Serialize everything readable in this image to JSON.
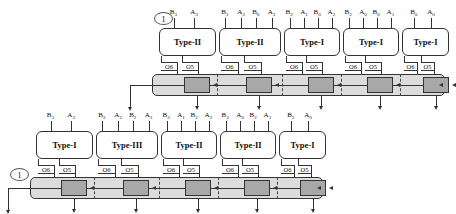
{
  "diagram": {
    "colors": {
      "bus_fill": "#dcdcdc",
      "register_fill": "#a8a8a8",
      "line": "#333333",
      "cell_fill": "#ffffff"
    },
    "output_taps": {
      "left_label": "O6",
      "right_label": "O5"
    },
    "rows": [
      {
        "id": "row-top",
        "marker": "1",
        "cells": [
          {
            "type": "Type-II",
            "inputs": [
              "B3",
              "A3"
            ]
          },
          {
            "type": "Type-II",
            "inputs": [
              "B3",
              "A2",
              "B0",
              "A3"
            ]
          },
          {
            "type": "Type-I",
            "inputs": [
              "B2",
              "A1",
              "B0",
              "A2"
            ]
          },
          {
            "type": "Type-I",
            "inputs": [
              "B2",
              "A0",
              "B0",
              "A1"
            ]
          },
          {
            "type": "Type-I",
            "inputs": [
              "B0",
              "A0"
            ]
          }
        ]
      },
      {
        "id": "row-bottom",
        "marker": "1",
        "cells": [
          {
            "type": "Type-I",
            "inputs": [
              "B3",
              "A3"
            ]
          },
          {
            "type": "Type-III",
            "inputs": [
              "B3",
              "A2",
              "B2",
              "A3"
            ]
          },
          {
            "type": "Type-II",
            "inputs": [
              "B3",
              "A1",
              "B2",
              "A2"
            ]
          },
          {
            "type": "Type-II",
            "inputs": [
              "B3",
              "A0",
              "B2",
              "A1"
            ]
          },
          {
            "type": "Type-I",
            "inputs": [
              "B2",
              "A0"
            ]
          }
        ]
      }
    ]
  }
}
